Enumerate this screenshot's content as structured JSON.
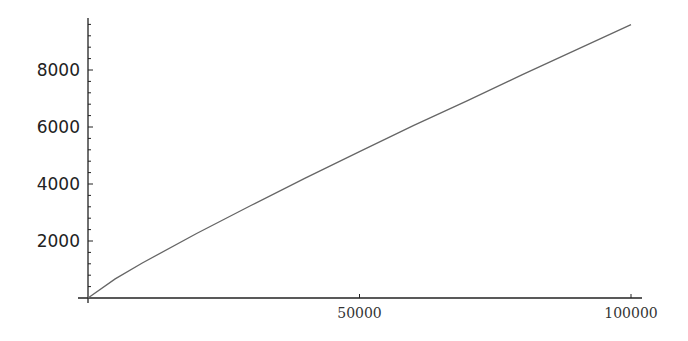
{
  "chart_data": {
    "type": "line",
    "title": "",
    "xlabel": "",
    "ylabel": "",
    "xlim": [
      0,
      100000
    ],
    "ylim": [
      0,
      9800
    ],
    "grid": false,
    "legend": null,
    "x_ticks": [
      50000,
      100000
    ],
    "x_tick_labels": [
      "50000",
      "100000"
    ],
    "y_ticks": [
      2000,
      4000,
      6000,
      8000
    ],
    "y_tick_labels": [
      "2000",
      "4000",
      "6000",
      "8000"
    ],
    "series": [
      {
        "name": "curve",
        "color": "#666666",
        "x": [
          0,
          5000,
          10000,
          20000,
          30000,
          40000,
          50000,
          60000,
          70000,
          80000,
          90000,
          100000
        ],
        "values": [
          0,
          669,
          1229,
          2262,
          3245,
          4203,
          5133,
          6057,
          6935,
          7837,
          8713,
          9592
        ]
      }
    ]
  }
}
